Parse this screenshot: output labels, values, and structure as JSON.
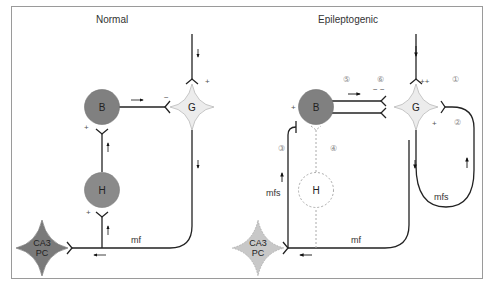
{
  "frame": {
    "border_color": "#9a9a9a",
    "background": "#ffffff"
  },
  "colors": {
    "basket_cell": "#808080",
    "hilar_cell": "#8a8a8a",
    "granule_cell_fill": "#ececec",
    "granule_cell_stroke": "#b8b8b8",
    "ca3_normal": "#7a7a7a",
    "ca3_epileptogenic": "#c8c8c8",
    "line": "#222222",
    "dashed": "#aaaaaa"
  },
  "panels": {
    "normal": {
      "title": "Normal",
      "nodes": {
        "basket": "B",
        "granule": "G",
        "hilar": "H",
        "ca3_line1": "CA3",
        "ca3_line2": "PC"
      },
      "signs": {
        "granule_input": "+",
        "basket_to_granule": "−",
        "hilar_to_basket": "+",
        "mf_to_hilar": "+"
      },
      "path_labels": {
        "mossy_fiber": "mf"
      }
    },
    "epileptogenic": {
      "title": "Epileptogenic",
      "nodes": {
        "basket": "B",
        "granule": "G",
        "hilar": "H",
        "ca3_line1": "CA3",
        "ca3_line2": "PC"
      },
      "signs": {
        "granule_input": "++",
        "basket_to_granule": "− −",
        "mfs_to_granule": "+",
        "mfs_to_basket": "+"
      },
      "numbers": [
        "①",
        "②",
        "③",
        "④",
        "⑤",
        "⑥"
      ],
      "path_labels": {
        "mossy_fiber": "mf",
        "mossy_fiber_sprouting_left": "mfs",
        "mossy_fiber_sprouting_right": "mfs"
      }
    }
  }
}
